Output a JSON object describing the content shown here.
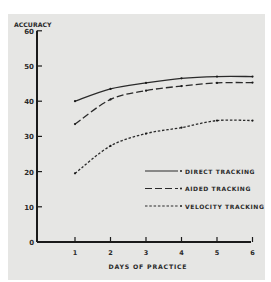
{
  "chart_data": {
    "type": "line",
    "title": "",
    "xlabel": "DAYS OF PRACTICE",
    "ylabel": "ACCURACY",
    "x": [
      1,
      2,
      3,
      4,
      5,
      6
    ],
    "xticks": [
      "1",
      "2",
      "3",
      "4",
      "5",
      "6"
    ],
    "yticks": [
      "0",
      "10",
      "20",
      "30",
      "40",
      "50",
      "60"
    ],
    "ylim": [
      0,
      60
    ],
    "xlim": [
      0,
      6
    ],
    "grid": false,
    "legend_position": "lower right (inside plot)",
    "series": [
      {
        "name": "DIRECT TRACKING",
        "style": "solid",
        "values": [
          40,
          43.5,
          45.2,
          46.5,
          47,
          47
        ]
      },
      {
        "name": "AIDED TRACKING",
        "style": "long-dash",
        "values": [
          33.5,
          40.5,
          43,
          44.3,
          45.2,
          45.3
        ]
      },
      {
        "name": "VELOCITY TRACKING",
        "style": "short-dash",
        "values": [
          19.5,
          27.3,
          30.8,
          32.5,
          34.5,
          34.5
        ]
      }
    ]
  },
  "labels": {
    "ylabel": "ACCURACY",
    "xlabel": "DAYS OF PRACTICE",
    "legend": [
      "DIRECT TRACKING",
      "AIDED TRACKING",
      "VELOCITY TRACKING"
    ]
  }
}
